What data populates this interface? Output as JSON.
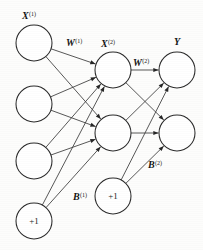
{
  "figure": {
    "background_color": "#fdfdfc",
    "ink_color": "#262626"
  },
  "labels": {
    "input_layer": {
      "base": "X",
      "sup": "(1)",
      "text": "X(1)"
    },
    "weights_1": {
      "base": "W",
      "sup": "(1)",
      "text": "W(1)"
    },
    "hidden_layer": {
      "base": "X",
      "sup": "(2)",
      "text": "X(2)"
    },
    "weights_2": {
      "base": "W",
      "sup": "(2)",
      "text": "W(2)"
    },
    "output_layer": {
      "base": "Y",
      "sup": "",
      "text": "Y"
    },
    "bias_1": {
      "base": "B",
      "sup": "(1)",
      "text": "B(1)"
    },
    "bias_2": {
      "base": "B",
      "sup": "(2)",
      "text": "B(2)"
    }
  },
  "bias_value": "+1",
  "layers": [
    {
      "name": "input",
      "label_key": "input_layer",
      "nodes": [
        {
          "id": "i1",
          "cx": 34,
          "cy": 43,
          "r": 18,
          "text": ""
        },
        {
          "id": "i2",
          "cx": 34,
          "cy": 104,
          "r": 18,
          "text": ""
        },
        {
          "id": "i3",
          "cx": 34,
          "cy": 161,
          "r": 18,
          "text": ""
        },
        {
          "id": "ib",
          "cx": 34,
          "cy": 221,
          "r": 18,
          "text": "+1"
        }
      ]
    },
    {
      "name": "hidden",
      "label_key": "hidden_layer",
      "nodes": [
        {
          "id": "h1",
          "cx": 113,
          "cy": 70,
          "r": 18,
          "text": ""
        },
        {
          "id": "h2",
          "cx": 113,
          "cy": 133,
          "r": 18,
          "text": ""
        },
        {
          "id": "hb",
          "cx": 113,
          "cy": 196,
          "r": 18,
          "text": "+1"
        }
      ]
    },
    {
      "name": "output",
      "label_key": "output_layer",
      "nodes": [
        {
          "id": "o1",
          "cx": 177,
          "cy": 70,
          "r": 18,
          "text": ""
        },
        {
          "id": "o2",
          "cx": 177,
          "cy": 133,
          "r": 18,
          "text": ""
        }
      ]
    }
  ],
  "edges": [
    {
      "from": "i1",
      "to": "h1"
    },
    {
      "from": "i1",
      "to": "h2"
    },
    {
      "from": "i2",
      "to": "h1"
    },
    {
      "from": "i2",
      "to": "h2"
    },
    {
      "from": "i3",
      "to": "h1"
    },
    {
      "from": "i3",
      "to": "h2"
    },
    {
      "from": "ib",
      "to": "h1"
    },
    {
      "from": "ib",
      "to": "h2"
    },
    {
      "from": "h1",
      "to": "o1"
    },
    {
      "from": "h1",
      "to": "o2"
    },
    {
      "from": "h2",
      "to": "o1"
    },
    {
      "from": "h2",
      "to": "o2"
    },
    {
      "from": "hb",
      "to": "o1"
    },
    {
      "from": "hb",
      "to": "o2"
    }
  ],
  "label_positions": {
    "input_layer": {
      "x": 22,
      "y": 19
    },
    "weights_1": {
      "x": 66,
      "y": 46
    },
    "hidden_layer": {
      "x": 101,
      "y": 47
    },
    "weights_2": {
      "x": 133,
      "y": 66
    },
    "output_layer": {
      "x": 174,
      "y": 45
    },
    "bias_1": {
      "x": 73,
      "y": 200
    },
    "bias_2": {
      "x": 148,
      "y": 168
    }
  }
}
